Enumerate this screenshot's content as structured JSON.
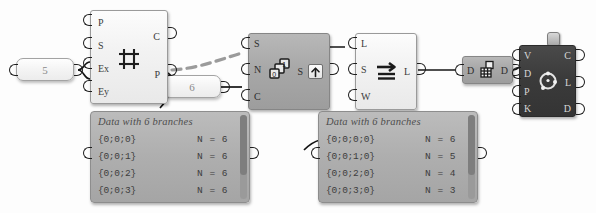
{
  "canvas": {
    "background": "#fdfdfd",
    "wire_color": "#141414",
    "accent_dark": "#3b3b3b"
  },
  "params": [
    {
      "name": "slider-5",
      "value": "5"
    },
    {
      "name": "slider-6",
      "value": "6"
    }
  ],
  "nodes": [
    {
      "id": "grid-component",
      "icon": "grid-hash-icon",
      "style": "light",
      "inputs": [
        "P",
        "S",
        "Ex",
        "Ey"
      ],
      "outputs": [
        "C",
        "P"
      ]
    },
    {
      "id": "graft-component",
      "icon": "tree-branch-icon",
      "style": "mid",
      "inputs": [
        "S",
        "N",
        "C"
      ],
      "outputs": [
        "S"
      ],
      "button": "up-arrow-button"
    },
    {
      "id": "shift-component",
      "icon": "shift-arrow-icon",
      "style": "light",
      "inputs": [
        "L",
        "S",
        "W"
      ],
      "outputs": [
        "L"
      ]
    },
    {
      "id": "flatten-component",
      "icon": "flatten-icon",
      "style": "mid",
      "inputs": [
        "D"
      ],
      "outputs": [
        "D"
      ]
    },
    {
      "id": "deconstruct-component",
      "icon": "target-dots-icon",
      "style": "dark",
      "inputs": [
        "V",
        "D",
        "P",
        "K"
      ],
      "outputs": [
        "C",
        "L",
        "D"
      ]
    }
  ],
  "panels": [
    {
      "id": "data-panel-left",
      "title": "Data with 6 branches",
      "columns": [
        "path",
        "count"
      ],
      "rows": [
        {
          "path": "{0;0;0}",
          "count": "N = 6"
        },
        {
          "path": "{0;0;1}",
          "count": "N = 6"
        },
        {
          "path": "{0;0;2}",
          "count": "N = 6"
        },
        {
          "path": "{0;0;3}",
          "count": "N = 6"
        }
      ]
    },
    {
      "id": "data-panel-right",
      "title": "Data with 6 branches",
      "columns": [
        "path",
        "count"
      ],
      "rows": [
        {
          "path": "{0;0;0;0}",
          "count": "N = 6"
        },
        {
          "path": "{0;0;1;0}",
          "count": "N = 5"
        },
        {
          "path": "{0;0;2;0}",
          "count": "N = 4"
        },
        {
          "path": "{0;0;3;0}",
          "count": "N = 3"
        }
      ]
    }
  ]
}
